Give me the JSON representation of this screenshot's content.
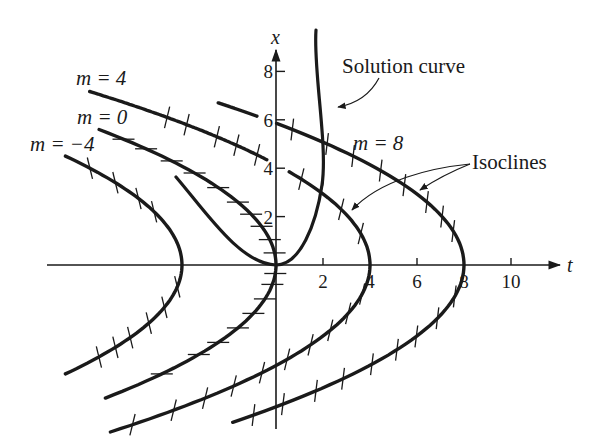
{
  "figure": {
    "type": "isocline-direction-field",
    "colors": {
      "ink": "#1a1a1a",
      "background": "#ffffff"
    },
    "axes": {
      "origin_px": [
        276,
        265
      ],
      "px_per_unit_t": 23.5,
      "px_per_unit_x": 24.2,
      "t_axis": {
        "label": "t",
        "from_px": 47,
        "to_px": 560,
        "ticks": [
          2,
          4,
          6,
          8,
          10
        ],
        "tick_labels": [
          "2",
          "4",
          "6",
          "8",
          "10"
        ]
      },
      "x_axis": {
        "label": "x",
        "from_px": 429,
        "to_px": 50,
        "ticks": [
          2,
          4,
          6,
          8
        ],
        "tick_labels": [
          "2",
          "4",
          "6",
          "8"
        ]
      }
    },
    "isoclines": [
      {
        "m": -4,
        "label": "m = −4",
        "k": 0.245,
        "x_range": [
          -4.5,
          4.5
        ],
        "gaps": [],
        "ticks_x": [
          4.0,
          3.4,
          2.75,
          2.2,
          -0.9,
          -1.75,
          -2.4,
          -3.0,
          -3.4,
          -3.8
        ]
      },
      {
        "m": 0,
        "label": "m = 0",
        "k": 0.24,
        "x_range": [
          -5.5,
          5.6
        ],
        "gaps": [],
        "ticks_x": [
          5.2,
          4.8,
          4.3,
          3.8,
          3.2,
          2.6,
          2.1,
          1.6,
          1.05,
          0.5,
          -0.35,
          -0.8,
          -1.4,
          -2.0,
          -2.6,
          -3.2,
          -3.7,
          -4.5
        ]
      },
      {
        "m": 4,
        "label": "m = 4",
        "k": 0.232,
        "x_range": [
          -6.9,
          7.17
        ],
        "gaps": [
          [
            3.85,
            4.35
          ]
        ],
        "ticks_x": [
          6.1,
          5.8,
          5.3,
          4.95,
          4.55,
          3.55,
          3.0,
          2.3,
          1.3,
          -1.2,
          -2.0,
          -2.7,
          -3.3,
          -3.9,
          -4.45,
          -5.0,
          -5.5,
          -6.0,
          -6.6
        ]
      },
      {
        "m": 8,
        "label": "m = 8",
        "k": 0.233,
        "x_range": [
          -6.5,
          6.7
        ],
        "gaps": [
          [
            5.85,
            6.15
          ]
        ],
        "ticks_x": [
          5.6,
          5.0,
          4.5,
          3.9,
          3.3,
          2.6,
          2.0,
          1.4,
          -1.3,
          -2.2,
          -2.95,
          -3.5,
          -4.1,
          -4.7,
          -5.2,
          -5.75,
          -6.2
        ]
      }
    ],
    "solution_curve": {
      "label": "Solution curve",
      "path_px": "M176,177 C205,210 235,262 270,265 C300,266 318,210 324,160 C329,120 313,30 316,30",
      "path_px_alt": "M176,177 C206,212 240,264 276,265 C300,265 316,225 322,185 C328,145 313,70 316,30"
    },
    "labels": [
      {
        "id": "label-m4",
        "text": "m = 4",
        "x": 76,
        "y": 85
      },
      {
        "id": "label-m0",
        "text": "m = 0",
        "x": 77,
        "y": 124
      },
      {
        "id": "label-m-4",
        "text": "m = −4",
        "x": 30,
        "y": 151
      },
      {
        "id": "label-m8",
        "text": "m = 8",
        "x": 353,
        "y": 150
      },
      {
        "id": "label-solution",
        "text": "Solution curve",
        "x": 342,
        "y": 73
      },
      {
        "id": "label-isoclines",
        "text": "Isoclines",
        "x": 472,
        "y": 169
      }
    ],
    "annotations": {
      "solution_arrow": "M379,78 C370,95 355,104 338,107",
      "isocline_arrows": [
        "M470,164 C430,168 380,180 352,210",
        "M470,164 C455,170 435,180 420,190"
      ]
    }
  }
}
